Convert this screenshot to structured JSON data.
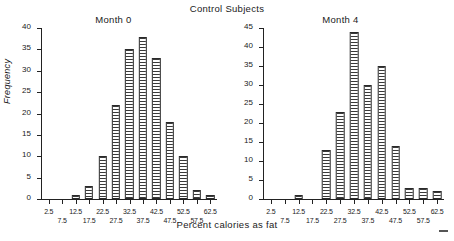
{
  "figure": {
    "super_title": "Control Subjects",
    "x_axis_label": "Percent calories as fat",
    "y_axis_label": "Frequency",
    "artifact_note": "—"
  },
  "chart_data": [
    {
      "type": "bar",
      "title": "Month 0",
      "xlabel": "Percent calories as fat",
      "ylabel": "Frequency",
      "categories": [
        "2.5",
        "7.5",
        "12.5",
        "17.5",
        "22.5",
        "27.5",
        "32.5",
        "37.5",
        "42.5",
        "47.5",
        "52.5",
        "57.5",
        "62.5"
      ],
      "values": [
        0,
        0,
        1,
        3,
        10,
        22,
        35,
        38,
        33,
        18,
        10,
        2,
        1
      ],
      "ylim": [
        0,
        40
      ],
      "yticks": [
        0,
        5,
        10,
        15,
        20,
        25,
        30,
        35,
        40
      ],
      "grid": false,
      "legend": false
    },
    {
      "type": "bar",
      "title": "Month 4",
      "xlabel": "Percent calories as fat",
      "ylabel": "Frequency",
      "categories": [
        "2.5",
        "7.5",
        "12.5",
        "17.5",
        "22.5",
        "27.5",
        "32.5",
        "37.5",
        "42.5",
        "47.5",
        "52.5",
        "57.5",
        "62.5"
      ],
      "values": [
        0,
        0,
        1,
        0,
        13,
        23,
        44,
        30,
        35,
        14,
        3,
        3,
        2
      ],
      "ylim": [
        0,
        45
      ],
      "yticks": [
        0,
        5,
        10,
        15,
        20,
        25,
        30,
        35,
        40,
        45
      ],
      "grid": false,
      "legend": false
    }
  ],
  "colors": {
    "axis": "#222222",
    "bar_outline": "#2a2a2a",
    "bar_hatch": "#3a3a3a",
    "background": "#ffffff"
  }
}
